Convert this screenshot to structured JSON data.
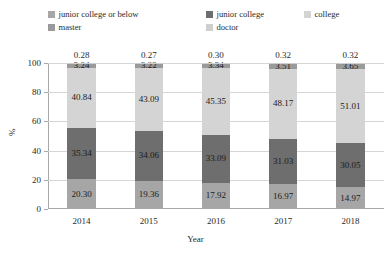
{
  "chart_data": {
    "type": "bar",
    "stacked": true,
    "stack_mode": "percent",
    "title": "",
    "xlabel": "Year",
    "ylabel": "%",
    "categories": [
      "2014",
      "2015",
      "2016",
      "2017",
      "2018"
    ],
    "ylim": [
      0,
      100
    ],
    "yticks": [
      0,
      20,
      40,
      60,
      80,
      100
    ],
    "ytick_labels": [
      "0",
      "20",
      "40",
      "60",
      "80",
      "100"
    ],
    "grid": true,
    "grid_axis": "y",
    "legend_position": "top",
    "series": [
      {
        "name": "junior college or below",
        "color": "#a6a6a6",
        "values": [
          20.3,
          19.36,
          17.92,
          16.97,
          14.97
        ],
        "labels": [
          "20.30",
          "19.36",
          "17.92",
          "16.97",
          "14.97"
        ],
        "labels_inside": true
      },
      {
        "name": "junior college",
        "color": "#6e6e6e",
        "values": [
          35.34,
          34.06,
          33.09,
          31.03,
          30.05
        ],
        "labels": [
          "35.34",
          "34.06",
          "33.09",
          "31.03",
          "30.05"
        ],
        "labels_inside": true
      },
      {
        "name": "college",
        "color": "#d4d4d4",
        "values": [
          40.84,
          43.09,
          45.35,
          48.17,
          51.01
        ],
        "labels": [
          "40.84",
          "43.09",
          "45.35",
          "48.17",
          "51.01"
        ],
        "labels_inside": true
      },
      {
        "name": "master",
        "color": "#9a9a9a",
        "values": [
          3.24,
          3.22,
          3.34,
          3.51,
          3.65
        ],
        "labels": [
          "3.24",
          "3.22",
          "3.34",
          "3.51",
          "3.65"
        ],
        "labels_inside": true
      },
      {
        "name": "doctor",
        "color": "#cfcfcf",
        "values": [
          0.28,
          0.27,
          0.3,
          0.32,
          0.32
        ],
        "labels": [
          "0.28",
          "0.27",
          "0.30",
          "0.32",
          "0.32"
        ],
        "labels_inside": false
      }
    ]
  }
}
